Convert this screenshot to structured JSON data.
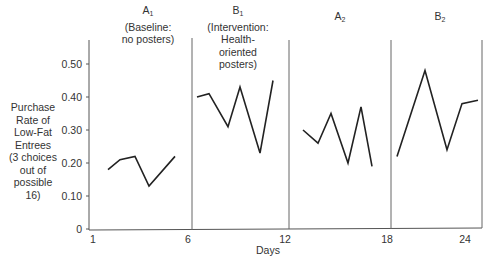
{
  "chart_data": {
    "type": "line",
    "title": "",
    "xlabel": "Days",
    "ylabel": "Purchase Rate of Low-Fat Entrees (3 choices out of possible 16)",
    "ylim": [
      0,
      0.55
    ],
    "y_ticks": [
      "0",
      "0.10",
      "0.20",
      "0.30",
      "0.40",
      "0.50"
    ],
    "x_ticks": [
      "1",
      "6",
      "12",
      "18",
      "24"
    ],
    "grid": false,
    "legend": "none",
    "phases": [
      {
        "letter": "A",
        "sub": "1",
        "desc": [
          "(Baseline:",
          "no posters)"
        ]
      },
      {
        "letter": "B",
        "sub": "1",
        "desc": [
          "(Intervention:",
          "Health-",
          "oriented",
          "posters)"
        ]
      },
      {
        "letter": "A",
        "sub": "2",
        "desc": []
      },
      {
        "letter": "B",
        "sub": "2",
        "desc": []
      }
    ],
    "series": [
      {
        "name": "A1 Baseline",
        "x": [
          2,
          3,
          4,
          5,
          6
        ],
        "values": [
          0.18,
          0.21,
          0.22,
          0.13,
          0.22
        ]
      },
      {
        "name": "B1 Intervention",
        "x": [
          7,
          8,
          9,
          10,
          11,
          12
        ],
        "values": [
          0.4,
          0.41,
          0.31,
          0.43,
          0.23,
          0.45
        ]
      },
      {
        "name": "A2",
        "x": [
          13,
          14,
          15,
          16,
          17,
          18
        ],
        "values": [
          0.3,
          0.26,
          0.35,
          0.2,
          0.37,
          0.19
        ]
      },
      {
        "name": "B2",
        "x": [
          19,
          21,
          23,
          24,
          25
        ],
        "values": [
          0.22,
          0.48,
          0.24,
          0.38,
          0.39
        ]
      }
    ]
  },
  "labels": {
    "ylabel_lines": [
      "Purchase",
      "Rate of",
      "Low-Fat",
      "Entrees",
      "(3 choices",
      "out of",
      "possible",
      "16)"
    ],
    "xtitle": "Days"
  }
}
